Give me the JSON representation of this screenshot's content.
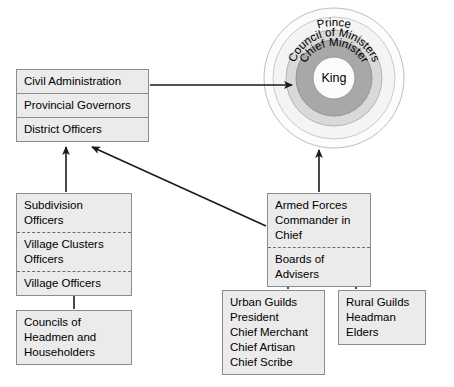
{
  "diagram": {
    "colors": {
      "box_fill": "#ebebeb",
      "box_border": "#8c8c8c",
      "ring_outer": "#f4f4f4",
      "ring_council": "#d9d9d9",
      "ring_chief": "#a8a8a8",
      "ring_king": "#fbfbfb",
      "line": "#1a1a1a"
    }
  },
  "center": {
    "rings": [
      {
        "name": "prince-ring",
        "label": "Prince"
      },
      {
        "name": "council-ministers-ring",
        "label": "Council of Ministers"
      },
      {
        "name": "chief-minister-ring",
        "label": "Chief Minister"
      },
      {
        "name": "king-core",
        "label": "King"
      }
    ]
  },
  "boxes": {
    "civil_administration": {
      "name": "civil-administration-group",
      "cells": [
        {
          "label": "Civil Administration",
          "divider": "none"
        },
        {
          "label": "Provincial Governors",
          "divider": "solid"
        },
        {
          "label": "District Officers",
          "divider": "solid"
        }
      ]
    },
    "lower_administration": {
      "name": "lower-administration-group",
      "cells": [
        {
          "label": "Subdivision Officers",
          "divider": "none"
        },
        {
          "label": "Village Clusters\nOfficers",
          "divider": "dashed"
        },
        {
          "label": "Village Officers",
          "divider": "dashed"
        }
      ]
    },
    "councils": {
      "name": "councils-group",
      "cells": [
        {
          "label": "Councils of\nHeadmen and\nHouseholders",
          "divider": "none"
        }
      ]
    },
    "armed_forces": {
      "name": "armed-forces-group",
      "cells": [
        {
          "label": "Armed Forces\nCommander in Chief",
          "divider": "none"
        },
        {
          "label": "Boards of Advisers",
          "divider": "dashed"
        }
      ]
    },
    "urban_guilds": {
      "name": "urban-guilds-group",
      "cells": [
        {
          "label": "Urban Guilds\nPresident\nChief Merchant\nChief Artisan\nChief Scribe",
          "divider": "none"
        }
      ]
    },
    "rural_guilds": {
      "name": "rural-guilds-group",
      "cells": [
        {
          "label": "Rural Guilds\nHeadman\nElders",
          "divider": "none"
        }
      ]
    }
  },
  "connectors": [
    {
      "name": "civil-admin-to-king-arrow",
      "from": "civil_administration",
      "to": "king-core"
    },
    {
      "name": "armed-forces-to-king-arrow",
      "from": "armed_forces",
      "to": "king-core"
    },
    {
      "name": "armed-forces-to-district-arrow",
      "from": "armed_forces",
      "to": "district-officers"
    },
    {
      "name": "subdivision-to-district-arrow",
      "from": "lower_administration",
      "to": "district-officers"
    },
    {
      "name": "councils-to-village-officers-arrow",
      "from": "councils",
      "to": "village-officers"
    },
    {
      "name": "urban-guilds-to-boards-arrow",
      "from": "urban_guilds",
      "to": "boards-of-advisers"
    },
    {
      "name": "rural-guilds-to-boards-arrow",
      "from": "rural_guilds",
      "to": "boards-of-advisers"
    }
  ]
}
